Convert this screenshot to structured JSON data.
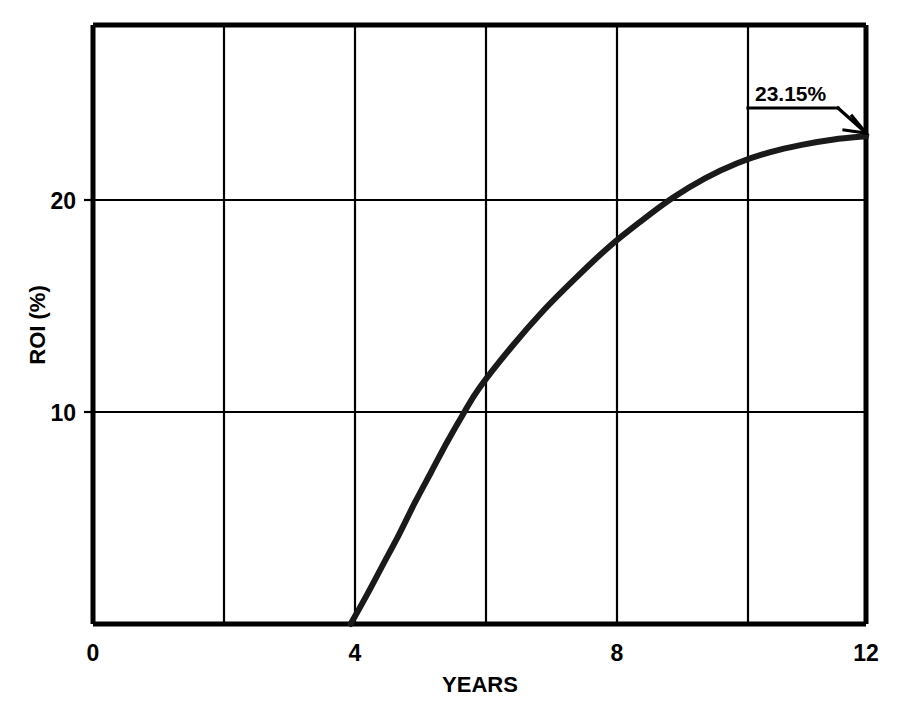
{
  "chart_data": {
    "type": "line",
    "title": "",
    "subtitle": "",
    "xlabel": "YEARS",
    "ylabel": "ROI (%)",
    "xlim": [
      0,
      12
    ],
    "ylim": [
      0.56,
      28.3
    ],
    "xticks": [
      0,
      4,
      8,
      12
    ],
    "xticklabels": [
      "0",
      "4",
      "8",
      "12"
    ],
    "yticks": [
      10,
      20
    ],
    "yticklabels": [
      "10",
      "20"
    ],
    "grid": true,
    "grid_x_values": [
      0,
      2,
      4,
      6,
      8,
      10,
      12
    ],
    "grid_y_values": [
      10,
      20
    ],
    "legend": null,
    "legend_position": "none",
    "series": [
      {
        "name": "ROI",
        "x": [
          4.0,
          4.25,
          4.5,
          4.75,
          5.0,
          5.25,
          5.5,
          5.75,
          6.0,
          6.5,
          7.0,
          7.5,
          8.0,
          8.5,
          9.0,
          9.5,
          10.0,
          10.5,
          11.0,
          11.5,
          12.0
        ],
        "y": [
          0.56,
          1.9,
          3.3,
          4.7,
          6.2,
          7.6,
          9.0,
          10.3,
          11.5,
          13.4,
          15.1,
          16.6,
          18.0,
          19.2,
          20.3,
          21.2,
          21.9,
          22.4,
          22.75,
          23.0,
          23.15
        ]
      }
    ],
    "annotations": [
      {
        "name": "endpoint-callout",
        "text": "23.15%",
        "at_x": 12,
        "at_y": 23.15,
        "style": "underlined-label-with-arrow-leader"
      }
    ]
  },
  "axes": {
    "x_axis_title": "YEARS",
    "y_axis_title": "ROI (%)",
    "x_tick_0": "0",
    "x_tick_4": "4",
    "x_tick_8": "8",
    "x_tick_12": "12",
    "y_tick_10": "10",
    "y_tick_20": "20"
  },
  "annotation": {
    "value_label": "23.15%"
  },
  "colors": {
    "background": "#ffffff",
    "ink": "#000000",
    "curve": "#1a1a1a",
    "grid": "#000000"
  }
}
